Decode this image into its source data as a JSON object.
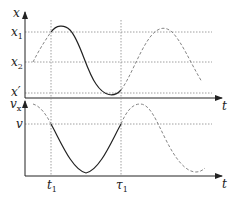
{
  "top_plot": {
    "y_axis_label": "x",
    "x_axis_label": "t",
    "levels": [
      {
        "name": "x1",
        "base": "x",
        "sub": "1"
      },
      {
        "name": "x2",
        "base": "x",
        "sub": "2"
      },
      {
        "name": "x_prime",
        "base": "x′",
        "sub": ""
      }
    ]
  },
  "bottom_plot": {
    "y_axis_label_base": "v",
    "y_axis_label_sub": "x",
    "x_axis_label": "t",
    "level_label": "v",
    "t_marks": [
      {
        "base": "t",
        "sub": "1"
      },
      {
        "base": "τ",
        "sub": "1"
      }
    ]
  },
  "colors": {
    "axis": "#222222",
    "solid_curve": "#222222",
    "dashed_curve": "#777777",
    "grid": "#888888"
  }
}
